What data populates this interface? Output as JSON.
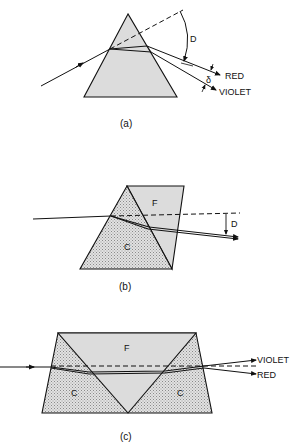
{
  "figure_a": {
    "caption": "(a)",
    "angle_label": "D",
    "dispersion_label": "δ",
    "ray_labels": {
      "red": "RED",
      "violet": "VIOLET"
    }
  },
  "figure_b": {
    "caption": "(b)",
    "angle_label": "D",
    "prism_labels": {
      "crown": "C",
      "flint": "F"
    }
  },
  "figure_c": {
    "caption": "(c)",
    "prism_labels": {
      "crown_left": "C",
      "flint": "F",
      "crown_right": "C"
    },
    "ray_labels": {
      "violet": "VIOLET",
      "red": "RED"
    }
  },
  "colors": {
    "line": "#111111",
    "prism_fill": "#dcdcdc",
    "stipple_fill": "#c8c8c8"
  }
}
